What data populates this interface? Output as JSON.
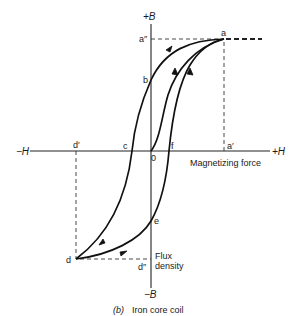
{
  "diagram": {
    "caption": {
      "part": "(b)",
      "text": "Iron core coil"
    },
    "axes": {
      "pos_b": "+B",
      "neg_b": "−B",
      "pos_h": "+H",
      "neg_h": "−H",
      "h_label": "Magnetizing force",
      "b_label_line1": "Flux",
      "b_label_line2": "density"
    },
    "points": {
      "a": "a",
      "a_prime": "a′",
      "a_double_prime": "a″",
      "b": "b",
      "c": "c",
      "o": "0",
      "f": "f",
      "d": "d",
      "d_prime": "d′",
      "d_double_prime": "d″",
      "e": "e"
    },
    "colors": {
      "line": "#111111",
      "background": "#ffffff"
    }
  }
}
